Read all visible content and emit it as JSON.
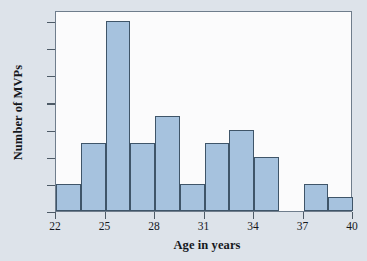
{
  "chart_data": {
    "type": "bar",
    "title": "",
    "xlabel": "Age in years",
    "ylabel": "Number of MVPs",
    "xlim": [
      22,
      40
    ],
    "ylim": [
      0,
      14.8
    ],
    "grid": false,
    "legend": null,
    "bin_width": 1.5,
    "xticks": [
      22,
      25,
      28,
      31,
      34,
      37,
      40
    ],
    "xtick_labels": [
      "22",
      "25",
      "28",
      "31",
      "34",
      "37",
      "40"
    ],
    "yticks": [
      0,
      2,
      4,
      6,
      8,
      10,
      12,
      14
    ],
    "ytick_labels": [
      "0",
      "2",
      "4",
      "6",
      "8",
      "10",
      "12",
      "14"
    ],
    "bins": [
      {
        "left": 22.0,
        "right": 23.5,
        "value": 2
      },
      {
        "left": 23.5,
        "right": 25.0,
        "value": 5
      },
      {
        "left": 25.0,
        "right": 26.5,
        "value": 14
      },
      {
        "left": 26.5,
        "right": 28.0,
        "value": 5
      },
      {
        "left": 28.0,
        "right": 29.5,
        "value": 7
      },
      {
        "left": 29.5,
        "right": 31.0,
        "value": 2
      },
      {
        "left": 31.0,
        "right": 32.5,
        "value": 5
      },
      {
        "left": 32.5,
        "right": 34.0,
        "value": 6
      },
      {
        "left": 34.0,
        "right": 35.5,
        "value": 4
      },
      {
        "left": 35.5,
        "right": 37.0,
        "value": 0
      },
      {
        "left": 37.0,
        "right": 38.5,
        "value": 2
      },
      {
        "left": 38.5,
        "right": 40.0,
        "value": 1
      }
    ],
    "categories": [
      "22-23.5",
      "23.5-25",
      "25-26.5",
      "26.5-28",
      "28-29.5",
      "29.5-31",
      "31-32.5",
      "32.5-34",
      "34-35.5",
      "35.5-37",
      "37-38.5",
      "38.5-40"
    ],
    "values": [
      2,
      5,
      14,
      5,
      7,
      2,
      5,
      6,
      4,
      0,
      2,
      1
    ],
    "colors": {
      "bar_fill": "#a6c2de",
      "bar_edge": "#3f5569",
      "plot_background": "#fbfbfc",
      "figure_background": "#dde3ea",
      "axis": "#6f7d8c",
      "text": "#15181c"
    }
  }
}
